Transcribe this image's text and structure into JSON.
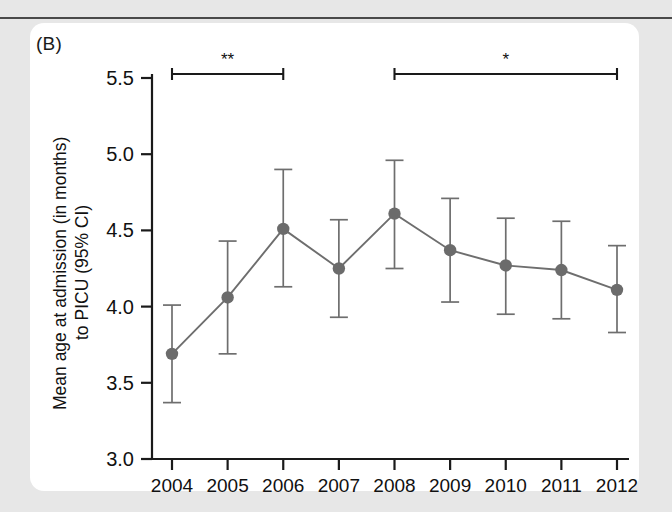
{
  "figure": {
    "panel_label": "(B)",
    "background_color": "#e7e7e7",
    "panel_color": "#ffffff",
    "marker_color": "#6b6b6b",
    "line_color": "#6e6e6e",
    "axis_color": "#1a1a1a"
  },
  "chart_data": {
    "type": "line",
    "title": "",
    "subtitle": "",
    "panel": "(B)",
    "xlabel": "",
    "ylabel": "Mean age at admission (in months) to PICU (95% CI)",
    "ylabel_line1": "Mean age at admission (in months)",
    "ylabel_line2": "to PICU (95% CI)",
    "categories": [
      "2004",
      "2005",
      "2006",
      "2007",
      "2008",
      "2009",
      "2010",
      "2011",
      "2012"
    ],
    "x": [
      2004,
      2005,
      2006,
      2007,
      2008,
      2009,
      2010,
      2011,
      2012
    ],
    "values": [
      3.69,
      4.06,
      4.51,
      4.25,
      4.61,
      4.37,
      4.27,
      4.24,
      4.11
    ],
    "ci_lower": [
      3.37,
      3.69,
      4.13,
      3.93,
      4.25,
      4.03,
      3.95,
      3.92,
      3.83
    ],
    "ci_upper": [
      4.01,
      4.43,
      4.9,
      4.57,
      4.96,
      4.71,
      4.58,
      4.56,
      4.4
    ],
    "error_type": "95% CI",
    "ylim": [
      3.0,
      5.5
    ],
    "yticks": [
      3.0,
      3.5,
      4.0,
      4.5,
      5.0,
      5.5
    ],
    "ytick_labels": [
      "3.0",
      "3.5",
      "4.0",
      "4.5",
      "5.0",
      "5.5"
    ],
    "xticks": [
      2004,
      2005,
      2006,
      2007,
      2008,
      2009,
      2010,
      2011,
      2012
    ],
    "xtick_labels": [
      "2004",
      "2005",
      "2006",
      "2007",
      "2008",
      "2009",
      "2010",
      "2011",
      "2012"
    ],
    "grid": false,
    "legend": null,
    "legend_position": "none",
    "annotations": [
      {
        "label": "**",
        "from": 2004,
        "to": 2006,
        "meaning": "significance bracket"
      },
      {
        "label": "*",
        "from": 2008,
        "to": 2012,
        "meaning": "significance bracket"
      }
    ]
  }
}
